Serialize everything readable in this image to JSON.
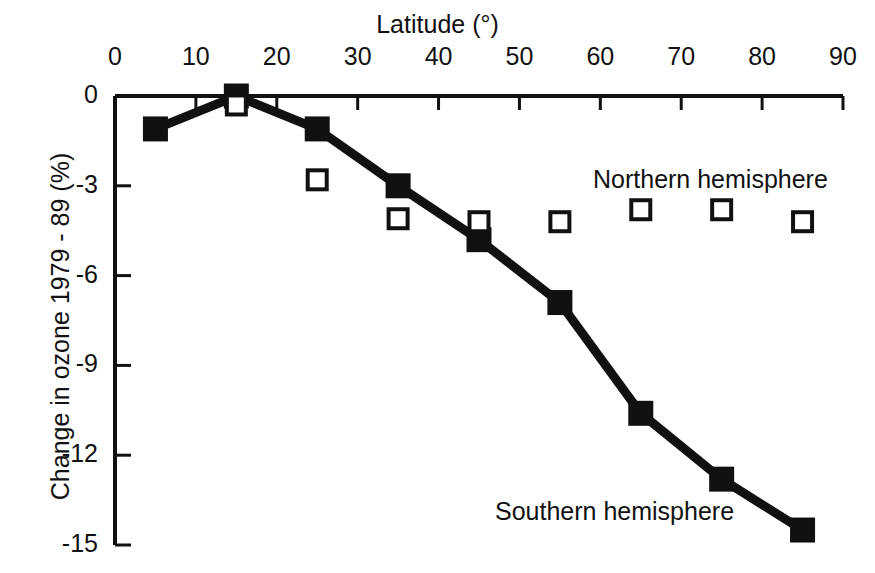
{
  "chart_data": {
    "type": "line",
    "title": "",
    "xlabel": "Latitude (°)",
    "ylabel": "Change in ozone 1979 - 89 (%)",
    "xlim": [
      0,
      90
    ],
    "ylim": [
      -15,
      0
    ],
    "xticks": [
      0,
      10,
      20,
      30,
      40,
      50,
      60,
      70,
      80,
      90
    ],
    "xtick_labels": [
      "0",
      "10",
      "20",
      "30",
      "40",
      "50",
      "60",
      "70",
      "80",
      "90"
    ],
    "yticks": [
      0,
      -3,
      -6,
      -9,
      -12,
      -15
    ],
    "ytick_labels": [
      "0",
      "-3",
      "-6",
      "-9",
      "-12",
      "-15"
    ],
    "grid": false,
    "legend_position": "inline-annotation",
    "x": [
      5,
      15,
      25,
      35,
      45,
      55,
      65,
      75,
      85
    ],
    "series": [
      {
        "name": "Southern hemisphere",
        "marker": "filled-square",
        "line": true,
        "color": "#111111",
        "values": [
          -1.1,
          0.0,
          -1.1,
          -3.0,
          -4.8,
          -6.9,
          -10.6,
          -12.8,
          -14.5
        ]
      },
      {
        "name": "Northern hemisphere",
        "marker": "open-square",
        "line": false,
        "color": "#111111",
        "values": [
          null,
          -0.3,
          -2.8,
          -4.1,
          -4.2,
          -4.2,
          -3.8,
          -3.8,
          -4.2
        ]
      }
    ],
    "annotations": [
      {
        "text": "Northern hemisphere",
        "x": 63,
        "y": -2.8
      },
      {
        "text": "Southern hemisphere",
        "x": 52,
        "y": -13.5
      }
    ]
  },
  "axis": {
    "x_title": "Latitude (°)",
    "y_title": "Change in ozone 1979 - 89 (%)"
  },
  "labels": {
    "northern": "Northern hemisphere",
    "southern": "Southern hemisphere"
  },
  "colors": {
    "ink": "#111111",
    "background": "#ffffff"
  }
}
